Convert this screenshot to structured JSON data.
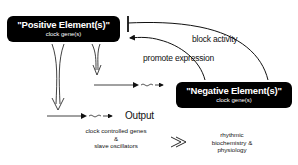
{
  "positive_box": {
    "title": "\"Positive Element(s)\"",
    "subtitle": "clock gene(s)"
  },
  "negative_box": {
    "title": "\"Negative Element(s)\"",
    "subtitle": "clock gene(s)"
  },
  "labels": {
    "block_activity": "block activity",
    "promote_expression": "promote expression",
    "output": "Output"
  },
  "outputs": {
    "left": [
      "clock controlled genes",
      "&",
      "slave oscillators"
    ],
    "right": [
      "rhythmic",
      "biochemistry &",
      "physiology"
    ]
  },
  "colors": {
    "box_fill": "#000000",
    "box_text": "#ffffff",
    "line": "#111111"
  }
}
